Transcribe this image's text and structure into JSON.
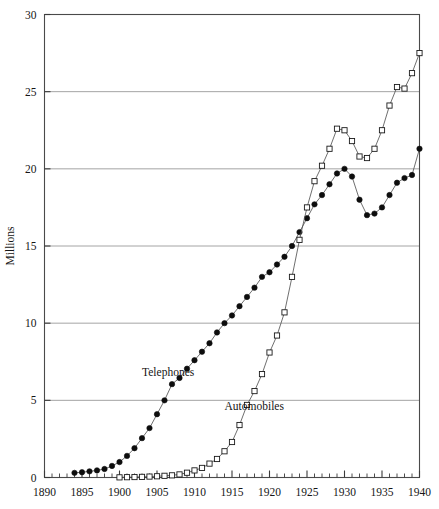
{
  "chart_data": {
    "type": "line",
    "title": "",
    "xlabel": "",
    "ylabel": "Millions",
    "xlim": [
      1890,
      1940
    ],
    "ylim": [
      0,
      30
    ],
    "grid": "horizontal-major-only",
    "legend_position": "inline-annotations",
    "x_ticks_major": [
      1890,
      1895,
      1900,
      1905,
      1910,
      1915,
      1920,
      1925,
      1930,
      1935,
      1940
    ],
    "x_tick_labels": [
      "1890",
      "1895",
      "1900",
      "1905",
      "1910",
      "1915",
      "1920",
      "1925",
      "1930",
      "1935",
      "1940"
    ],
    "x_tick_minor_step": 1,
    "y_ticks": [
      0,
      5,
      10,
      15,
      20,
      25,
      30
    ],
    "y_tick_labels": [
      "0",
      "5",
      "10",
      "15",
      "20",
      "25",
      "30"
    ],
    "series": [
      {
        "name": "Telephones",
        "marker": "filled-circle",
        "label_x": 1903.0,
        "label_y": 6.6,
        "x": [
          1894,
          1895,
          1896,
          1897,
          1898,
          1899,
          1900,
          1901,
          1902,
          1903,
          1904,
          1905,
          1906,
          1907,
          1908,
          1909,
          1910,
          1911,
          1912,
          1913,
          1914,
          1915,
          1916,
          1917,
          1918,
          1919,
          1920,
          1921,
          1922,
          1923,
          1924,
          1925,
          1926,
          1927,
          1928,
          1929,
          1930,
          1931,
          1932,
          1933,
          1934,
          1935,
          1936,
          1937,
          1938,
          1939,
          1940
        ],
        "values": [
          0.3,
          0.34,
          0.4,
          0.46,
          0.55,
          0.75,
          1.0,
          1.4,
          1.9,
          2.55,
          3.2,
          4.1,
          5.0,
          6.05,
          6.45,
          7.05,
          7.6,
          8.15,
          8.7,
          9.4,
          10.0,
          10.5,
          11.1,
          11.7,
          12.3,
          13.0,
          13.3,
          13.8,
          14.3,
          15.0,
          15.9,
          16.8,
          17.7,
          18.3,
          19.0,
          19.7,
          20.0,
          19.5,
          18.0,
          17.0,
          17.1,
          17.5,
          18.3,
          19.1,
          19.4,
          19.6,
          21.3
        ]
      },
      {
        "name": "Automobiles",
        "marker": "open-square",
        "label_x": 1914.0,
        "label_y": 4.4,
        "x": [
          1900,
          1901,
          1902,
          1903,
          1904,
          1905,
          1906,
          1907,
          1908,
          1909,
          1910,
          1911,
          1912,
          1913,
          1914,
          1915,
          1916,
          1917,
          1918,
          1919,
          1920,
          1921,
          1922,
          1923,
          1924,
          1925,
          1926,
          1927,
          1928,
          1929,
          1930,
          1931,
          1932,
          1933,
          1934,
          1935,
          1936,
          1937,
          1938,
          1939,
          1940
        ],
        "values": [
          0.01,
          0.02,
          0.03,
          0.04,
          0.06,
          0.08,
          0.11,
          0.14,
          0.2,
          0.31,
          0.46,
          0.62,
          0.9,
          1.2,
          1.7,
          2.3,
          3.4,
          4.7,
          5.6,
          6.7,
          8.1,
          9.2,
          10.7,
          13.0,
          15.4,
          17.5,
          19.2,
          20.2,
          21.3,
          22.6,
          22.5,
          21.8,
          20.8,
          20.7,
          21.3,
          22.5,
          24.1,
          25.3,
          25.2,
          26.2,
          27.5
        ]
      }
    ]
  }
}
